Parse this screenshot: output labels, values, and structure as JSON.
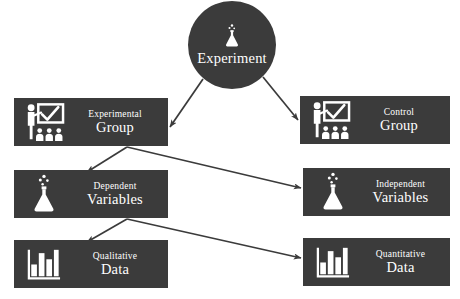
{
  "diagram": {
    "colors": {
      "node_fill": "#3b3b3b",
      "node_text": "#ffffff",
      "edge": "#3b3b3b",
      "background": "#ffffff"
    },
    "hub": {
      "label": "Experiment",
      "icon": "flask-icon",
      "cx": 232,
      "cy": 45,
      "r": 44
    },
    "nodes": [
      {
        "id": "experimental-group",
        "line1": "Experimental",
        "line2": "Group",
        "icon": "presenter-icon",
        "x": 14,
        "y": 98,
        "w": 154,
        "h": 48
      },
      {
        "id": "control-group",
        "line1": "Control",
        "line2": "Group",
        "icon": "presenter-icon",
        "x": 300,
        "y": 96,
        "w": 150,
        "h": 48
      },
      {
        "id": "dependent-variables",
        "line1": "Dependent",
        "line2": "Variables",
        "icon": "flask-bubbles-icon",
        "x": 14,
        "y": 170,
        "w": 154,
        "h": 48
      },
      {
        "id": "independent-variables",
        "line1": "Independent",
        "line2": "Variables",
        "icon": "flask-bubbles-icon",
        "x": 303,
        "y": 168,
        "w": 147,
        "h": 48
      },
      {
        "id": "qualitative-data",
        "line1": "Qualitative",
        "line2": "Data",
        "icon": "bar-chart-icon",
        "x": 14,
        "y": 240,
        "w": 154,
        "h": 48
      },
      {
        "id": "quantitative-data",
        "line1": "Quantitative",
        "line2": "Data",
        "icon": "bar-chart-icon",
        "x": 303,
        "y": 238,
        "w": 147,
        "h": 48
      }
    ],
    "edges": [
      {
        "id": "experiment-to-experimental-group",
        "from": "Experiment",
        "to": "Experimental Group"
      },
      {
        "id": "experiment-to-control-group",
        "from": "Experiment",
        "to": "Control Group"
      },
      {
        "id": "experimental-group-to-dependent-variables",
        "from": "Experimental Group",
        "to": "Dependent Variables"
      },
      {
        "id": "experimental-group-to-independent-variables",
        "from": "Experimental Group",
        "to": "Independent Variables"
      },
      {
        "id": "dependent-variables-to-qualitative-data",
        "from": "Dependent Variables",
        "to": "Qualitative Data"
      },
      {
        "id": "dependent-variables-to-quantitative-data",
        "from": "Dependent Variables",
        "to": "Quantitative Data"
      }
    ]
  }
}
